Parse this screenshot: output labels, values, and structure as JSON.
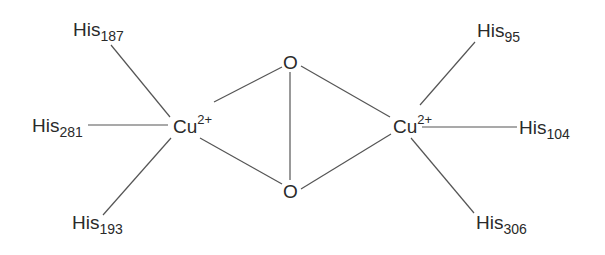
{
  "diagram": {
    "type": "coordination-structure",
    "left_copper": {
      "symbol": "Cu",
      "charge": "2+",
      "ligands": [
        {
          "name": "His",
          "residue": "187"
        },
        {
          "name": "His",
          "residue": "281"
        },
        {
          "name": "His",
          "residue": "193"
        }
      ]
    },
    "right_copper": {
      "symbol": "Cu",
      "charge": "2+",
      "ligands": [
        {
          "name": "His",
          "residue": "95"
        },
        {
          "name": "His",
          "residue": "104"
        },
        {
          "name": "His",
          "residue": "306"
        }
      ]
    },
    "bridge": {
      "top_oxygen": "O",
      "bottom_oxygen": "O"
    },
    "line_color": "#555555",
    "text_color": "#2a2a2a"
  }
}
